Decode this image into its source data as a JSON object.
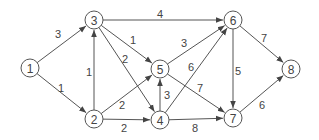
{
  "diagram": {
    "type": "directed-weighted-graph",
    "colors": {
      "stroke": "#555555",
      "text": "#444444",
      "background": "#ffffff"
    },
    "nodes": [
      {
        "id": "1",
        "label": "1",
        "x": 30,
        "y": 68
      },
      {
        "id": "2",
        "label": "2",
        "x": 94,
        "y": 119
      },
      {
        "id": "3",
        "label": "3",
        "x": 94,
        "y": 20
      },
      {
        "id": "4",
        "label": "4",
        "x": 160,
        "y": 120
      },
      {
        "id": "5",
        "label": "5",
        "x": 160,
        "y": 69
      },
      {
        "id": "6",
        "label": "6",
        "x": 233,
        "y": 20
      },
      {
        "id": "7",
        "label": "7",
        "x": 233,
        "y": 118
      },
      {
        "id": "8",
        "label": "8",
        "x": 291,
        "y": 69
      }
    ],
    "edges": [
      {
        "from": "1",
        "to": "3",
        "weight": "3",
        "lx": 58,
        "ly": 34
      },
      {
        "from": "1",
        "to": "2",
        "weight": "1",
        "lx": 61,
        "ly": 88
      },
      {
        "from": "2",
        "to": "3",
        "weight": "1",
        "lx": 89,
        "ly": 72
      },
      {
        "from": "3",
        "to": "5",
        "weight": "1",
        "lx": 133,
        "ly": 40
      },
      {
        "from": "3",
        "to": "4",
        "weight": "2",
        "lx": 125,
        "ly": 59
      },
      {
        "from": "3",
        "to": "6",
        "weight": "4",
        "lx": 160,
        "ly": 14
      },
      {
        "from": "2",
        "to": "5",
        "weight": "2",
        "lx": 122,
        "ly": 105
      },
      {
        "from": "2",
        "to": "4",
        "weight": "2",
        "lx": 124,
        "ly": 128
      },
      {
        "from": "4",
        "to": "5",
        "weight": "3",
        "lx": 167,
        "ly": 95
      },
      {
        "from": "4",
        "to": "6",
        "weight": "6",
        "lx": 191,
        "ly": 67
      },
      {
        "from": "5",
        "to": "6",
        "weight": "3",
        "lx": 184,
        "ly": 43
      },
      {
        "from": "5",
        "to": "7",
        "weight": "7",
        "lx": 200,
        "ly": 88
      },
      {
        "from": "4",
        "to": "7",
        "weight": "8",
        "lx": 195,
        "ly": 128
      },
      {
        "from": "6",
        "to": "7",
        "weight": "5",
        "lx": 238,
        "ly": 71
      },
      {
        "from": "6",
        "to": "8",
        "weight": "7",
        "lx": 264,
        "ly": 38
      },
      {
        "from": "7",
        "to": "8",
        "weight": "6",
        "lx": 262,
        "ly": 105
      }
    ]
  }
}
